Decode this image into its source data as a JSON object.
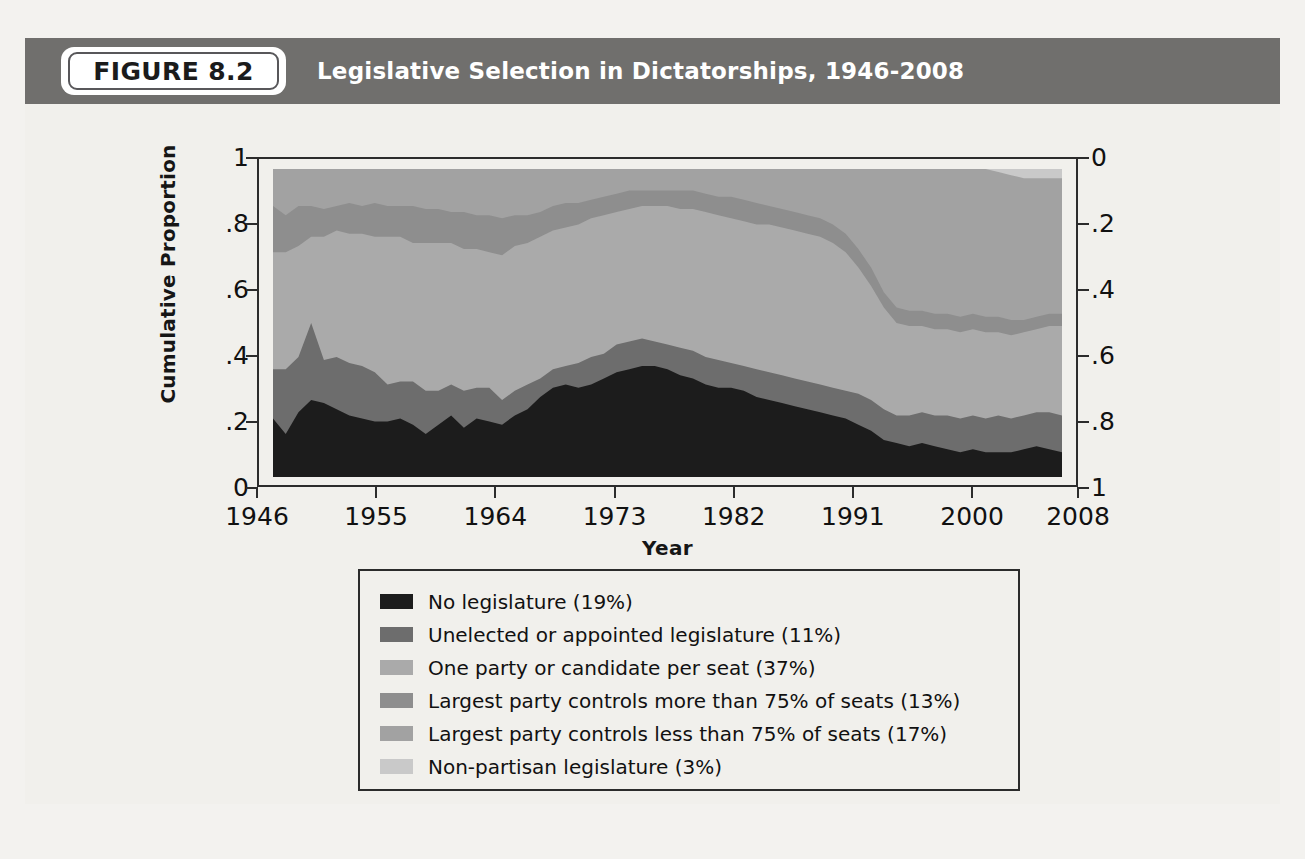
{
  "header": {
    "badge_label": "FIGURE 8.2",
    "title": "Legislative Selection in Dictatorships, 1946-2008"
  },
  "chart_data": {
    "type": "area",
    "title": "Legislative Selection in Dictatorships, 1946-2008",
    "xlabel": "Year",
    "ylabel": "Cumulative Proportion",
    "xlim": [
      1946,
      2008
    ],
    "ylim": [
      0,
      1
    ],
    "grid": false,
    "legend_position": "below-plot",
    "left_axis": {
      "label": "Cumulative Proportion",
      "ticks": [
        "0",
        ".2",
        ".4",
        ".6",
        ".8",
        "1"
      ],
      "values": [
        0,
        0.2,
        0.4,
        0.6,
        0.8,
        1
      ],
      "inverted": false
    },
    "right_axis": {
      "label": "",
      "ticks": [
        "0",
        ".2",
        ".4",
        ".6",
        ".8",
        "1"
      ],
      "values": [
        0,
        0.2,
        0.4,
        0.6,
        0.8,
        1
      ],
      "inverted": true
    },
    "x_ticks": [
      "1946",
      "1955",
      "1964",
      "1973",
      "1982",
      "1991",
      "2000",
      "2008"
    ],
    "x_tick_values": [
      1946,
      1955,
      1964,
      1973,
      1982,
      1991,
      2000,
      2008
    ],
    "x": [
      1946,
      1947,
      1948,
      1949,
      1950,
      1951,
      1952,
      1953,
      1954,
      1955,
      1956,
      1957,
      1958,
      1959,
      1960,
      1961,
      1962,
      1963,
      1964,
      1965,
      1966,
      1967,
      1968,
      1969,
      1970,
      1971,
      1972,
      1973,
      1974,
      1975,
      1976,
      1977,
      1978,
      1979,
      1980,
      1981,
      1982,
      1983,
      1984,
      1985,
      1986,
      1987,
      1988,
      1989,
      1990,
      1991,
      1992,
      1993,
      1994,
      1995,
      1996,
      1997,
      1998,
      1999,
      2000,
      2001,
      2002,
      2003,
      2004,
      2005,
      2006,
      2007,
      2008
    ],
    "stacked": true,
    "series": [
      {
        "name": "No legislature (19%)",
        "share_pct": 19,
        "color": "#1c1c1c",
        "values": [
          0.19,
          0.14,
          0.21,
          0.25,
          0.24,
          0.22,
          0.2,
          0.19,
          0.18,
          0.18,
          0.19,
          0.17,
          0.14,
          0.17,
          0.2,
          0.16,
          0.19,
          0.18,
          0.17,
          0.2,
          0.22,
          0.26,
          0.29,
          0.3,
          0.29,
          0.3,
          0.32,
          0.34,
          0.35,
          0.36,
          0.36,
          0.35,
          0.33,
          0.32,
          0.3,
          0.29,
          0.29,
          0.28,
          0.26,
          0.25,
          0.24,
          0.23,
          0.22,
          0.21,
          0.2,
          0.19,
          0.17,
          0.15,
          0.12,
          0.11,
          0.1,
          0.11,
          0.1,
          0.09,
          0.08,
          0.09,
          0.08,
          0.08,
          0.08,
          0.09,
          0.1,
          0.09,
          0.08
        ],
        "cumulative_top": [
          0.19,
          0.14,
          0.21,
          0.25,
          0.24,
          0.22,
          0.2,
          0.19,
          0.18,
          0.18,
          0.19,
          0.17,
          0.14,
          0.17,
          0.2,
          0.16,
          0.19,
          0.18,
          0.17,
          0.2,
          0.22,
          0.26,
          0.29,
          0.3,
          0.29,
          0.3,
          0.32,
          0.34,
          0.35,
          0.36,
          0.36,
          0.35,
          0.33,
          0.32,
          0.3,
          0.29,
          0.29,
          0.28,
          0.26,
          0.25,
          0.24,
          0.23,
          0.22,
          0.21,
          0.2,
          0.19,
          0.17,
          0.15,
          0.12,
          0.11,
          0.1,
          0.11,
          0.1,
          0.09,
          0.08,
          0.09,
          0.08,
          0.08,
          0.08,
          0.09,
          0.1,
          0.09,
          0.08
        ]
      },
      {
        "name": "Unelected or appointed legislature (11%)",
        "share_pct": 11,
        "color": "#6d6d6d",
        "values": [
          0.16,
          0.21,
          0.18,
          0.25,
          0.14,
          0.17,
          0.17,
          0.17,
          0.16,
          0.12,
          0.12,
          0.14,
          0.14,
          0.11,
          0.1,
          0.12,
          0.1,
          0.11,
          0.08,
          0.08,
          0.08,
          0.06,
          0.06,
          0.06,
          0.08,
          0.09,
          0.08,
          0.09,
          0.09,
          0.09,
          0.08,
          0.08,
          0.09,
          0.09,
          0.09,
          0.09,
          0.08,
          0.08,
          0.09,
          0.09,
          0.09,
          0.09,
          0.09,
          0.09,
          0.09,
          0.09,
          0.1,
          0.1,
          0.1,
          0.09,
          0.1,
          0.1,
          0.1,
          0.11,
          0.11,
          0.11,
          0.11,
          0.12,
          0.11,
          0.11,
          0.11,
          0.12,
          0.12
        ],
        "cumulative_top": [
          0.35,
          0.35,
          0.39,
          0.5,
          0.38,
          0.39,
          0.37,
          0.36,
          0.34,
          0.3,
          0.31,
          0.31,
          0.28,
          0.28,
          0.3,
          0.28,
          0.29,
          0.29,
          0.25,
          0.28,
          0.3,
          0.32,
          0.35,
          0.36,
          0.37,
          0.39,
          0.4,
          0.43,
          0.44,
          0.45,
          0.44,
          0.43,
          0.42,
          0.41,
          0.39,
          0.38,
          0.37,
          0.36,
          0.35,
          0.34,
          0.33,
          0.32,
          0.31,
          0.3,
          0.29,
          0.28,
          0.27,
          0.25,
          0.22,
          0.2,
          0.2,
          0.21,
          0.2,
          0.2,
          0.19,
          0.2,
          0.19,
          0.2,
          0.19,
          0.2,
          0.21,
          0.21,
          0.2
        ]
      },
      {
        "name": "One party or candidate per seat (37%)",
        "share_pct": 37,
        "color": "#aaaaaa",
        "values": [
          0.38,
          0.38,
          0.36,
          0.28,
          0.4,
          0.41,
          0.42,
          0.43,
          0.44,
          0.48,
          0.47,
          0.45,
          0.48,
          0.48,
          0.46,
          0.46,
          0.45,
          0.44,
          0.47,
          0.47,
          0.46,
          0.46,
          0.45,
          0.45,
          0.45,
          0.45,
          0.45,
          0.43,
          0.43,
          0.43,
          0.44,
          0.45,
          0.45,
          0.46,
          0.47,
          0.47,
          0.47,
          0.47,
          0.47,
          0.48,
          0.48,
          0.48,
          0.48,
          0.48,
          0.47,
          0.45,
          0.41,
          0.37,
          0.33,
          0.3,
          0.29,
          0.28,
          0.28,
          0.28,
          0.28,
          0.28,
          0.28,
          0.27,
          0.27,
          0.27,
          0.27,
          0.28,
          0.29
        ],
        "cumulative_top": [
          0.73,
          0.73,
          0.75,
          0.78,
          0.78,
          0.8,
          0.79,
          0.79,
          0.78,
          0.78,
          0.78,
          0.76,
          0.76,
          0.76,
          0.76,
          0.74,
          0.74,
          0.73,
          0.72,
          0.75,
          0.76,
          0.78,
          0.8,
          0.81,
          0.82,
          0.84,
          0.85,
          0.86,
          0.87,
          0.88,
          0.88,
          0.88,
          0.87,
          0.87,
          0.86,
          0.85,
          0.84,
          0.83,
          0.82,
          0.82,
          0.81,
          0.8,
          0.79,
          0.78,
          0.76,
          0.73,
          0.68,
          0.62,
          0.55,
          0.5,
          0.49,
          0.49,
          0.48,
          0.48,
          0.47,
          0.48,
          0.47,
          0.47,
          0.46,
          0.47,
          0.48,
          0.49,
          0.49
        ]
      },
      {
        "name": "Largest party controls more than 75% of seats (13%)",
        "share_pct": 13,
        "color": "#8e8e8e",
        "values": [
          0.15,
          0.12,
          0.13,
          0.1,
          0.09,
          0.08,
          0.1,
          0.09,
          0.11,
          0.1,
          0.1,
          0.12,
          0.11,
          0.11,
          0.1,
          0.12,
          0.11,
          0.12,
          0.12,
          0.1,
          0.09,
          0.08,
          0.08,
          0.08,
          0.07,
          0.06,
          0.06,
          0.06,
          0.06,
          0.05,
          0.05,
          0.05,
          0.06,
          0.06,
          0.06,
          0.06,
          0.07,
          0.07,
          0.07,
          0.06,
          0.06,
          0.06,
          0.06,
          0.06,
          0.06,
          0.06,
          0.06,
          0.06,
          0.05,
          0.05,
          0.05,
          0.05,
          0.05,
          0.05,
          0.05,
          0.05,
          0.05,
          0.05,
          0.05,
          0.04,
          0.04,
          0.04,
          0.04
        ],
        "cumulative_top": [
          0.88,
          0.85,
          0.88,
          0.88,
          0.87,
          0.88,
          0.89,
          0.88,
          0.89,
          0.88,
          0.88,
          0.88,
          0.87,
          0.87,
          0.86,
          0.86,
          0.85,
          0.85,
          0.84,
          0.85,
          0.85,
          0.86,
          0.88,
          0.89,
          0.89,
          0.9,
          0.91,
          0.92,
          0.93,
          0.93,
          0.93,
          0.93,
          0.93,
          0.93,
          0.92,
          0.91,
          0.91,
          0.9,
          0.89,
          0.88,
          0.87,
          0.86,
          0.85,
          0.84,
          0.82,
          0.79,
          0.74,
          0.68,
          0.6,
          0.55,
          0.54,
          0.54,
          0.53,
          0.53,
          0.52,
          0.53,
          0.52,
          0.52,
          0.51,
          0.51,
          0.52,
          0.53,
          0.53
        ]
      },
      {
        "name": "Largest party controls less than 75% of seats (17%)",
        "share_pct": 17,
        "color": "#a2a2a2",
        "values": [
          0.12,
          0.15,
          0.12,
          0.12,
          0.13,
          0.12,
          0.11,
          0.12,
          0.11,
          0.12,
          0.12,
          0.12,
          0.13,
          0.13,
          0.14,
          0.14,
          0.15,
          0.15,
          0.16,
          0.15,
          0.15,
          0.14,
          0.12,
          0.11,
          0.11,
          0.1,
          0.09,
          0.08,
          0.07,
          0.07,
          0.07,
          0.07,
          0.07,
          0.07,
          0.08,
          0.09,
          0.09,
          0.1,
          0.11,
          0.12,
          0.13,
          0.14,
          0.15,
          0.16,
          0.18,
          0.21,
          0.26,
          0.32,
          0.4,
          0.45,
          0.46,
          0.46,
          0.47,
          0.47,
          0.48,
          0.47,
          0.48,
          0.47,
          0.47,
          0.46,
          0.45,
          0.44,
          0.44
        ],
        "cumulative_top": [
          1.0,
          1.0,
          1.0,
          1.0,
          1.0,
          1.0,
          1.0,
          1.0,
          1.0,
          1.0,
          1.0,
          1.0,
          1.0,
          1.0,
          1.0,
          1.0,
          1.0,
          1.0,
          1.0,
          1.0,
          1.0,
          1.0,
          1.0,
          1.0,
          1.0,
          1.0,
          1.0,
          1.0,
          1.0,
          1.0,
          1.0,
          1.0,
          1.0,
          1.0,
          1.0,
          1.0,
          1.0,
          1.0,
          1.0,
          1.0,
          1.0,
          1.0,
          1.0,
          1.0,
          1.0,
          1.0,
          1.0,
          1.0,
          1.0,
          1.0,
          1.0,
          1.0,
          1.0,
          1.0,
          1.0,
          1.0,
          1.0,
          0.99,
          0.98,
          0.97,
          0.97,
          0.97,
          0.97
        ]
      },
      {
        "name": "Non-partisan legislature (3%)",
        "share_pct": 3,
        "color": "#c9c9c9",
        "values": [
          0.0,
          0.0,
          0.0,
          0.0,
          0.0,
          0.0,
          0.0,
          0.0,
          0.0,
          0.0,
          0.0,
          0.0,
          0.0,
          0.0,
          0.0,
          0.0,
          0.0,
          0.0,
          0.0,
          0.0,
          0.0,
          0.0,
          0.0,
          0.0,
          0.0,
          0.0,
          0.0,
          0.0,
          0.0,
          0.0,
          0.0,
          0.0,
          0.0,
          0.0,
          0.0,
          0.0,
          0.0,
          0.0,
          0.0,
          0.0,
          0.0,
          0.0,
          0.0,
          0.0,
          0.0,
          0.0,
          0.0,
          0.0,
          0.0,
          0.0,
          0.0,
          0.0,
          0.0,
          0.01,
          0.02,
          0.0,
          0.0,
          0.01,
          0.02,
          0.03,
          0.03,
          0.03,
          0.03
        ],
        "cumulative_top": [
          1.0,
          1.0,
          1.0,
          1.0,
          1.0,
          1.0,
          1.0,
          1.0,
          1.0,
          1.0,
          1.0,
          1.0,
          1.0,
          1.0,
          1.0,
          1.0,
          1.0,
          1.0,
          1.0,
          1.0,
          1.0,
          1.0,
          1.0,
          1.0,
          1.0,
          1.0,
          1.0,
          1.0,
          1.0,
          1.0,
          1.0,
          1.0,
          1.0,
          1.0,
          1.0,
          1.0,
          1.0,
          1.0,
          1.0,
          1.0,
          1.0,
          1.0,
          1.0,
          1.0,
          1.0,
          1.0,
          1.0,
          1.0,
          1.0,
          1.0,
          1.0,
          1.0,
          1.0,
          1.0,
          1.0,
          1.0,
          1.0,
          1.0,
          1.0,
          1.0,
          1.0,
          1.0,
          1.0
        ]
      }
    ]
  },
  "legend": {
    "items": [
      {
        "label": "No legislature (19%)",
        "color": "#1c1c1c"
      },
      {
        "label": "Unelected or appointed legislature (11%)",
        "color": "#6d6d6d"
      },
      {
        "label": "One party or candidate per seat (37%)",
        "color": "#aaaaaa"
      },
      {
        "label": "Largest party controls more than 75% of seats (13%)",
        "color": "#8e8e8e"
      },
      {
        "label": "Largest party controls less than 75% of seats (17%)",
        "color": "#a2a2a2"
      },
      {
        "label": "Non-partisan legislature (3%)",
        "color": "#c9c9c9"
      }
    ]
  }
}
